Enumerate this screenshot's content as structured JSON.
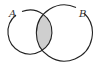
{
  "diagram": {
    "type": "venn",
    "sets": [
      {
        "label": "A",
        "cx": 30,
        "cy": 32,
        "r": 22
      },
      {
        "label": "B",
        "cx": 64,
        "cy": 33,
        "r": 28
      }
    ],
    "shaded_region": "A ∩ B",
    "colors": {
      "stroke": "#222222",
      "shade": "#cfcfcf",
      "background": "#ffffff"
    }
  }
}
